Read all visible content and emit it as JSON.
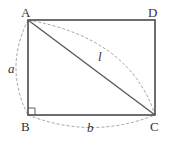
{
  "diagram": {
    "type": "rectangle-with-diagonal",
    "vertices": {
      "A": {
        "label": "A",
        "x": 28,
        "y": 20
      },
      "D": {
        "label": "D",
        "x": 155,
        "y": 20
      },
      "B": {
        "label": "B",
        "x": 28,
        "y": 115
      },
      "C": {
        "label": "C",
        "x": 155,
        "y": 115
      }
    },
    "diagonal": {
      "from": "A",
      "to": "C",
      "label": "l"
    },
    "side_labels": {
      "AB": "a",
      "BC": "b"
    },
    "right_angle_at": "B",
    "colors": {
      "edge": "#4a4a4a",
      "dashed": "#9a9a9a",
      "text": "#333333"
    }
  }
}
